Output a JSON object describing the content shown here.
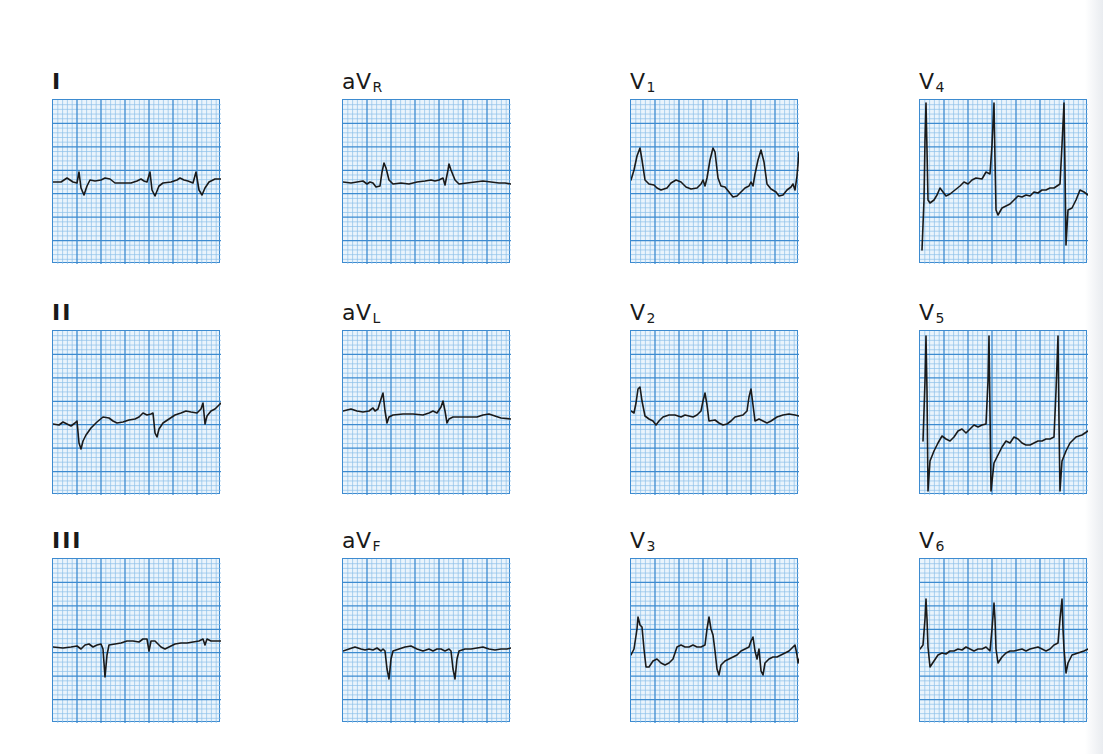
{
  "figure": {
    "grid": {
      "major_divisions_x": 7,
      "major_divisions_y": 7,
      "minor_per_major": 5,
      "colors": {
        "paper": "#eaf4fc",
        "minor_line": "#8cc0ea",
        "major_line": "#3d8bd0",
        "trace": "#1a1a1a"
      }
    },
    "leads": [
      {
        "id": "I",
        "label": "I",
        "sub": "",
        "style": "roman",
        "row": 0,
        "col": 0
      },
      {
        "id": "aVR",
        "label": "aV",
        "sub": "R",
        "style": "aug",
        "row": 0,
        "col": 1
      },
      {
        "id": "V1",
        "label": "V",
        "sub": "1",
        "style": "prec",
        "row": 0,
        "col": 2
      },
      {
        "id": "V4",
        "label": "V",
        "sub": "4",
        "style": "prec",
        "row": 0,
        "col": 3
      },
      {
        "id": "II",
        "label": "II",
        "sub": "",
        "style": "roman",
        "row": 1,
        "col": 0
      },
      {
        "id": "aVL",
        "label": "aV",
        "sub": "L",
        "style": "aug",
        "row": 1,
        "col": 1
      },
      {
        "id": "V2",
        "label": "V",
        "sub": "2",
        "style": "prec",
        "row": 1,
        "col": 2
      },
      {
        "id": "V5",
        "label": "V",
        "sub": "5",
        "style": "prec",
        "row": 1,
        "col": 3
      },
      {
        "id": "III",
        "label": "III",
        "sub": "",
        "style": "roman",
        "row": 2,
        "col": 0
      },
      {
        "id": "aVF",
        "label": "aV",
        "sub": "F",
        "style": "aug",
        "row": 2,
        "col": 1
      },
      {
        "id": "V3",
        "label": "V",
        "sub": "3",
        "style": "prec",
        "row": 2,
        "col": 2
      },
      {
        "id": "V6",
        "label": "V",
        "sub": "6",
        "style": "prec",
        "row": 2,
        "col": 3
      }
    ],
    "traces": {
      "I": "M0,82 L8,82 L11,80 L14,78 L17,80 L20,82 L24,83 L26,72 L28,88 L31,95 L34,86 L37,80 L42,81 L48,80 L52,78 L57,79 L62,83 L70,83 L78,83 L84,81 L88,79 L91,81 L94,82 L97,72 L99,90 L102,96 L106,86 L110,83 L118,82 L124,80 L127,78 L131,80 L135,81 L140,83 L143,72 L146,90 L149,95 L152,88 L156,82 L162,79 L168,79",
      "aVR": "M0,82 L8,83 L14,82 L20,81 L24,84 L27,82 L30,83 L33,87 L37,86 L39,72 L41,63 L43,68 L46,80 L50,84 L58,83 L66,84 L74,82 L82,81 L88,80 L92,81 L96,80 L100,78 L102,85 L105,70 L106,64 L108,70 L112,80 L116,84 L124,83 L132,82 L140,81 L148,82 L156,83 L162,83 L168,84",
      "V1": "M0,80 L3,70 L6,56 L9,48 L11,60 L14,80 L18,84 L23,85 L26,88 L30,90 L36,88 L40,83 L45,80 L50,82 L55,87 L60,89 L66,88 L70,84 L72,80 L74,86 L76,78 L79,60 L82,48 L84,52 L87,78 L90,86 L94,87 L98,92 L102,97 L106,96 L110,92 L114,88 L118,86 L120,82 L122,86 L124,74 L127,60 L130,50 L133,62 L136,84 L140,89 L145,92 L148,96 L152,95 L156,90 L160,87 L162,84 L164,90 L166,76 L168,52",
      "V4": "M2,150 L4,100 L5,40 L6,3 L7,50 L8,100 L10,103 L14,100 L17,95 L20,88 L23,92 L26,96 L30,94 L35,90 L40,86 L44,82 L48,84 L52,80 L56,78 L62,79 L66,72 L70,74 L72,45 L74,3 L75,60 L76,110 L78,115 L82,108 L86,106 L90,104 L94,100 L98,96 L102,97 L106,95 L110,96 L114,92 L118,93 L122,90 L126,90 L130,88 L134,88 L140,84 L142,45 L144,3 L145,70 L146,145 L148,110 L152,108 L156,100 L160,90 L164,92 L168,95",
      "II": "M0,93 L6,94 L10,91 L14,93 L18,95 L22,92 L24,90 L26,112 L28,118 L30,110 L33,104 L38,97 L44,91 L50,86 L56,87 L60,90 L64,92 L70,91 L76,89 L82,88 L86,86 L90,82 L94,84 L98,83 L100,82 L102,102 L104,106 L106,98 L110,92 L116,88 L122,84 L128,82 L133,80 L138,81 L144,82 L148,78 L150,72 L152,93 L154,85 L158,80 L162,78 L166,74 L168,72",
      "aVL": "M0,80 L8,78 L14,80 L20,81 L26,80 L30,77 L32,80 L35,78 L38,68 L40,62 L42,80 L44,92 L46,86 L50,84 L60,83 L70,83 L80,84 L86,82 L90,80 L94,82 L98,76 L100,70 L102,80 L104,92 L106,88 L110,86 L118,86 L126,86 L134,86 L140,84 L146,83 L152,85 L158,87 L168,88",
      "V2": "M0,80 L3,82 L5,72 L7,58 L9,56 L11,70 L14,85 L18,88 L22,90 L25,94 L28,90 L32,86 L38,84 L44,84 L50,86 L54,84 L58,85 L62,86 L66,84 L70,80 L72,70 L74,62 L76,74 L78,90 L84,89 L88,92 L92,94 L96,93 L100,90 L104,86 L108,85 L112,84 L116,80 L118,66 L120,58 L122,74 L124,90 L128,88 L132,90 L136,92 L140,90 L146,86 L152,84 L158,83 L164,84 L168,85",
      "V5": "M3,110 L5,50 L6,5 L7,60 L8,160 L10,130 L14,120 L18,112 L22,105 L26,108 L30,110 L34,106 L38,100 L42,98 L46,102 L50,98 L54,94 L58,96 L62,94 L66,93 L68,50 L69,5 L70,80 L71,160 L74,132 L78,124 L82,116 L86,110 L90,112 L94,106 L98,108 L102,112 L106,114 L110,114 L114,112 L118,110 L122,110 L126,108 L130,108 L134,106 L136,60 L138,5 L139,90 L140,160 L142,130 L146,120 L150,112 L156,106 L162,104 L168,100",
      "III": "M0,88 L10,89 L18,88 L24,87 L28,90 L32,86 L36,85 L40,88 L44,86 L48,85 L50,90 L52,118 L54,96 L56,86 L62,85 L68,84 L74,82 L80,82 L86,83 L90,80 L94,80 L96,92 L98,82 L102,82 L108,88 L112,90 L116,88 L122,85 L128,84 L134,84 L140,83 L146,82 L150,80 L152,86 L154,80 L158,82 L162,82 L168,82",
      "aVF": "M0,92 L6,90 L12,88 L18,90 L22,91 L26,90 L30,91 L34,89 L38,92 L40,90 L42,92 L44,110 L46,120 L48,100 L50,92 L56,90 L62,88 L68,87 L74,90 L80,92 L86,90 L90,92 L94,90 L98,90 L102,92 L106,90 L108,92 L110,110 L112,120 L114,100 L116,92 L122,90 L128,90 L134,89 L140,88 L146,90 L152,91 L158,90 L164,90 L168,89",
      "V3": "M0,96 L3,90 L6,70 L7,58 L9,66 L11,68 L13,90 L15,108 L18,108 L22,102 L26,100 L30,104 L34,106 L38,104 L42,100 L44,94 L46,88 L50,86 L54,88 L58,88 L62,86 L66,88 L70,88 L74,86 L76,70 L78,58 L80,70 L82,76 L84,92 L86,110 L88,116 L90,106 L94,102 L98,100 L102,98 L106,96 L110,92 L114,90 L118,88 L120,82 L122,78 L124,92 L126,100 L128,90 L130,112 L132,116 L134,104 L138,100 L142,98 L146,98 L150,96 L154,94 L158,92 L162,88 L164,86 L166,96 L167,104 L168,100",
      "V6": "M0,90 L3,86 L5,60 L6,40 L7,60 L8,88 L10,108 L14,102 L18,96 L22,94 L26,95 L30,92 L34,92 L38,90 L42,91 L46,88 L50,90 L54,92 L58,90 L62,90 L66,88 L70,92 L72,70 L74,44 L75,60 L76,90 L78,104 L82,98 L86,94 L90,92 L94,92 L98,91 L102,90 L106,92 L110,90 L114,89 L118,88 L122,90 L126,92 L130,90 L134,86 L138,84 L140,60 L142,40 L143,70 L144,90 L146,114 L148,104 L152,96 L158,94 L164,92 L168,90"
    }
  },
  "chart_data": {
    "type": "line",
    "layout": {
      "rows": 3,
      "cols": 4
    },
    "grid": true,
    "series": [
      {
        "name": "I"
      },
      {
        "name": "aVR"
      },
      {
        "name": "V1"
      },
      {
        "name": "V4"
      },
      {
        "name": "II"
      },
      {
        "name": "aVL"
      },
      {
        "name": "V2"
      },
      {
        "name": "V5"
      },
      {
        "name": "III"
      },
      {
        "name": "aVF"
      },
      {
        "name": "V3"
      },
      {
        "name": "V6"
      }
    ]
  }
}
